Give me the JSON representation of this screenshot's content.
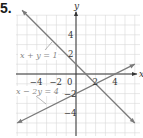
{
  "problem": {
    "number": "5."
  },
  "chart_data": {
    "type": "line",
    "title": "",
    "xlabel": "x",
    "ylabel": "y",
    "xlim": [
      -6,
      6
    ],
    "ylim": [
      -6,
      6
    ],
    "grid": true,
    "x_ticks": [
      {
        "value": -4,
        "label": "−4"
      },
      {
        "value": -2,
        "label": "−2"
      },
      {
        "value": 0,
        "label": "0"
      },
      {
        "value": 2,
        "label": "2"
      },
      {
        "value": 4,
        "label": "4"
      }
    ],
    "y_ticks": [
      {
        "value": 4,
        "label": "4"
      },
      {
        "value": 2,
        "label": "2"
      },
      {
        "value": -2,
        "label": "−2"
      },
      {
        "value": -4,
        "label": "−4"
      }
    ],
    "series": [
      {
        "name": "x + y = 1",
        "equation": "x + y = 1",
        "color": "#7a7a7a",
        "points": [
          [
            -5.5,
            6.5
          ],
          [
            6,
            -5
          ]
        ]
      },
      {
        "name": "x − 2y = 4",
        "equation": "x − 2y = 4",
        "color": "#7a7a7a",
        "points": [
          [
            -6,
            -5
          ],
          [
            6,
            1
          ]
        ]
      }
    ],
    "intersection": [
      2,
      -1
    ],
    "annotations": [
      {
        "text": "x + y = 1",
        "target_series": 0
      },
      {
        "text": "x − 2y = 4",
        "target_series": 1
      }
    ]
  }
}
